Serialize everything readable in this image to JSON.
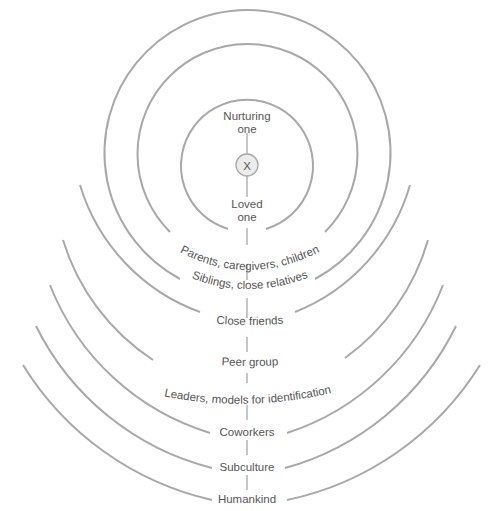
{
  "diagram": {
    "title": "",
    "center": {
      "label": "X"
    },
    "top_label": {
      "line1": "Nurturing",
      "line2": "one"
    },
    "inner_label": {
      "line1": "Loved",
      "line2": "one"
    },
    "rings": [
      {
        "label": "Parents, caregivers, children"
      },
      {
        "label": "Siblings, close relatives"
      },
      {
        "label": "Close friends"
      },
      {
        "label": "Peer group"
      },
      {
        "label": "Leaders, models for identification"
      },
      {
        "label": "Coworkers"
      },
      {
        "label": "Subculture"
      },
      {
        "label": "Humankind"
      }
    ],
    "colors": {
      "line": "#a8a8a8",
      "text": "#555555",
      "center_fill": "#ececec"
    }
  }
}
